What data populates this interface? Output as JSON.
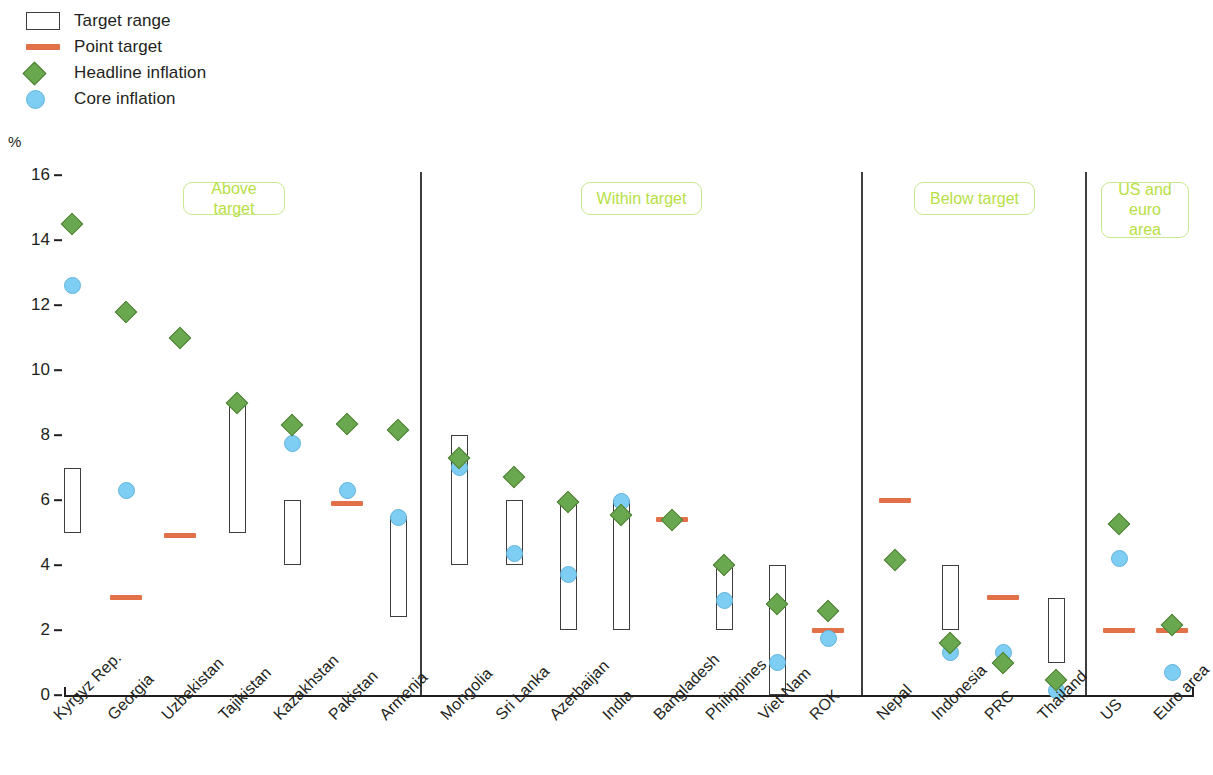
{
  "legend": {
    "items": [
      {
        "icon": "target-range-swatch",
        "label": "Target range"
      },
      {
        "icon": "point-target-swatch",
        "label": "Point target"
      },
      {
        "icon": "headline-inflation-diamond",
        "label": "Headline inflation"
      },
      {
        "icon": "core-inflation-circle",
        "label": "Core inflation"
      }
    ]
  },
  "colors": {
    "headline": "#6aa84f",
    "core": "#7ecdf2",
    "point_target": "#e2714a",
    "band_outline": "#3d3d3d",
    "panel_label_text": "#b7e045",
    "panel_label_border": "#c8e98c",
    "axis": "#231f20"
  },
  "panels": [
    {
      "name": "above-target",
      "label": "Above target"
    },
    {
      "name": "within-target",
      "label": "Within target"
    },
    {
      "name": "below-target",
      "label": "Below target"
    },
    {
      "name": "us-euro-area",
      "label": "US and\neuro area"
    }
  ],
  "chart_data": {
    "type": "scatter",
    "title": "",
    "xlabel": "",
    "ylabel": "%",
    "ylim": [
      0,
      16
    ],
    "yticks": [
      0,
      2,
      4,
      6,
      8,
      10,
      12,
      14,
      16
    ],
    "grid": false,
    "legend_position": "top-left",
    "axis_unit": "%",
    "categories": [
      "Kyrgyz Rep.",
      "Georgia",
      "Uzbekistan",
      "Tajikistan",
      "Kazakhstan",
      "Pakistan",
      "Armenia",
      "Mongolia",
      "Sri Lanka",
      "Azerbaijan",
      "India",
      "Bangladesh",
      "Philippines",
      "Viet Nam",
      "ROK",
      "Nepal",
      "Indonesia",
      "PRC",
      "Thailand",
      "US",
      "Euro area"
    ],
    "series": [
      {
        "name": "Headline inflation",
        "values": [
          14.5,
          11.8,
          11.0,
          9.0,
          8.3,
          8.35,
          8.15,
          7.3,
          6.7,
          5.95,
          5.55,
          5.4,
          4.0,
          2.8,
          2.6,
          4.15,
          1.6,
          1.0,
          0.45,
          5.25,
          2.15
        ]
      },
      {
        "name": "Core inflation",
        "values": [
          12.6,
          6.3,
          null,
          null,
          7.75,
          6.3,
          5.45,
          7.0,
          4.35,
          3.7,
          5.95,
          null,
          2.9,
          1.0,
          1.75,
          null,
          1.3,
          1.3,
          0.15,
          4.2,
          0.7
        ]
      }
    ],
    "target_ranges": [
      {
        "category": "Kyrgyz Rep.",
        "low": 5.0,
        "high": 7.0
      },
      {
        "category": "Tajikistan",
        "low": 5.0,
        "high": 9.0
      },
      {
        "category": "Kazakhstan",
        "low": 4.0,
        "high": 6.0
      },
      {
        "category": "Armenia",
        "low": 2.4,
        "high": 5.5
      },
      {
        "category": "Mongolia",
        "low": 4.0,
        "high": 8.0
      },
      {
        "category": "Sri Lanka",
        "low": 4.0,
        "high": 6.0
      },
      {
        "category": "Azerbaijan",
        "low": 2.0,
        "high": 6.0
      },
      {
        "category": "India",
        "low": 2.0,
        "high": 6.0
      },
      {
        "category": "Philippines",
        "low": 2.0,
        "high": 4.0
      },
      {
        "category": "Viet Nam",
        "low": 0.0,
        "high": 4.0
      },
      {
        "category": "Indonesia",
        "low": 2.0,
        "high": 4.0
      },
      {
        "category": "Thailand",
        "low": 1.0,
        "high": 3.0
      }
    ],
    "point_targets": [
      {
        "category": "Georgia",
        "value": 3.0
      },
      {
        "category": "Uzbekistan",
        "value": 4.9
      },
      {
        "category": "Pakistan",
        "value": 5.9
      },
      {
        "category": "Bangladesh",
        "value": 5.4
      },
      {
        "category": "ROK",
        "value": 2.0
      },
      {
        "category": "Nepal",
        "value": 6.0
      },
      {
        "category": "PRC",
        "value": 3.0
      },
      {
        "category": "US",
        "value": 2.0
      },
      {
        "category": "Euro area",
        "value": 2.0
      }
    ],
    "panel_membership": {
      "above-target": [
        "Kyrgyz Rep.",
        "Georgia",
        "Uzbekistan",
        "Tajikistan",
        "Kazakhstan",
        "Pakistan",
        "Armenia"
      ],
      "within-target": [
        "Mongolia",
        "Sri Lanka",
        "Azerbaijan",
        "India",
        "Bangladesh",
        "Philippines",
        "Viet Nam",
        "ROK"
      ],
      "below-target": [
        "Nepal",
        "Indonesia",
        "PRC",
        "Thailand"
      ],
      "us-euro-area": [
        "US",
        "Euro area"
      ]
    }
  }
}
